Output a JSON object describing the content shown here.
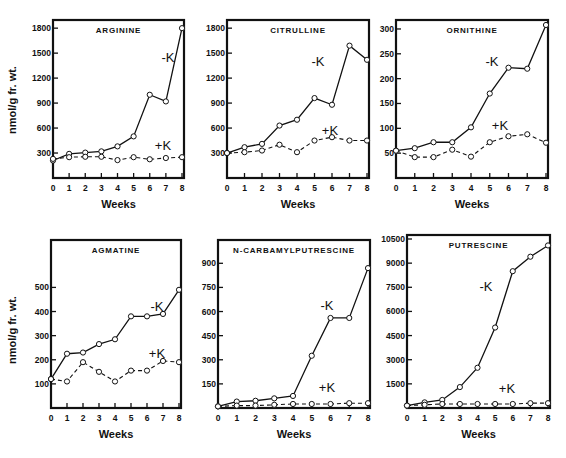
{
  "figure": {
    "y_axis_label": "nmol/g fr. wt.",
    "x_axis_label": "Weeks"
  },
  "chart_data": [
    {
      "type": "line",
      "title": "ARGININE",
      "xlabel": "Weeks",
      "ylabel": "nmol/g fr. wt.",
      "x": [
        0,
        1,
        2,
        3,
        4,
        5,
        6,
        7,
        8
      ],
      "yticks": [
        300,
        600,
        900,
        1200,
        1500,
        1800
      ],
      "ylim": [
        0,
        1850
      ],
      "frame": {
        "x0": 53,
        "x1": 184,
        "y0": 20,
        "y1": 178
      },
      "label_pos": {
        "minusK": [
          168,
          62
        ],
        "plusK": [
          163,
          150
        ]
      },
      "series": [
        {
          "name": "-K",
          "values": [
            210,
            290,
            305,
            320,
            380,
            500,
            1000,
            920,
            1800
          ]
        },
        {
          "name": "+K",
          "values": [
            230,
            250,
            255,
            255,
            215,
            250,
            225,
            240,
            250
          ]
        }
      ]
    },
    {
      "type": "line",
      "title": "CITRULLINE",
      "xlabel": "Weeks",
      "ylabel": "",
      "x": [
        0,
        1,
        2,
        3,
        4,
        5,
        6,
        7,
        8
      ],
      "yticks": [
        300,
        600,
        900,
        1200,
        1500,
        1800
      ],
      "ylim": [
        0,
        1850
      ],
      "frame": {
        "x0": 227,
        "x1": 369,
        "y0": 20,
        "y1": 178
      },
      "label_pos": {
        "minusK": [
          318,
          66
        ],
        "plusK": [
          330,
          135
        ]
      },
      "series": [
        {
          "name": "-K",
          "values": [
            300,
            370,
            410,
            630,
            700,
            960,
            880,
            1590,
            1420
          ]
        },
        {
          "name": "+K",
          "values": [
            300,
            310,
            330,
            400,
            310,
            450,
            490,
            450,
            450
          ]
        }
      ]
    },
    {
      "type": "line",
      "title": "ORNITHINE",
      "xlabel": "Weeks",
      "ylabel": "",
      "x": [
        0,
        1,
        2,
        3,
        4,
        5,
        6,
        7,
        8
      ],
      "yticks": [
        50,
        100,
        150,
        200,
        250,
        300
      ],
      "ylim": [
        0,
        310
      ],
      "frame": {
        "x0": 396,
        "x1": 548,
        "y0": 20,
        "y1": 178
      },
      "label_pos": {
        "minusK": [
          492,
          66
        ],
        "plusK": [
          500,
          130
        ]
      },
      "series": [
        {
          "name": "-K",
          "values": [
            55,
            60,
            72,
            72,
            102,
            170,
            222,
            220,
            308
          ]
        },
        {
          "name": "+K",
          "values": [
            55,
            42,
            42,
            57,
            43,
            72,
            84,
            88,
            71
          ]
        }
      ]
    },
    {
      "type": "line",
      "title": "AGMATINE",
      "xlabel": "Weeks",
      "ylabel": "nmol/g fr. wt.",
      "x": [
        0,
        1,
        2,
        3,
        4,
        5,
        6,
        7,
        8
      ],
      "yticks": [
        100,
        200,
        300,
        400,
        500
      ],
      "ylim": [
        0,
        680
      ],
      "frame": {
        "x0": 51,
        "x1": 181,
        "y0": 240,
        "y1": 408
      },
      "label_pos": {
        "minusK": [
          157,
          311
        ],
        "plusK": [
          157,
          358
        ]
      },
      "series": [
        {
          "name": "-K",
          "values": [
            120,
            225,
            230,
            265,
            285,
            380,
            380,
            390,
            490
          ]
        },
        {
          "name": "+K",
          "values": [
            120,
            110,
            190,
            150,
            110,
            155,
            155,
            195,
            190
          ]
        }
      ]
    },
    {
      "type": "line",
      "title": "N-CARBAMYLPUTRESCINE",
      "title_italic_prefix": "N",
      "xlabel": "Weeks",
      "ylabel": "",
      "x": [
        0,
        1,
        2,
        3,
        4,
        5,
        6,
        7,
        8
      ],
      "yticks": [
        150,
        300,
        450,
        600,
        750,
        900
      ],
      "ylim": [
        0,
        1020
      ],
      "frame": {
        "x0": 218,
        "x1": 370,
        "y0": 240,
        "y1": 408
      },
      "label_pos": {
        "minusK": [
          327,
          310
        ],
        "plusK": [
          327,
          392
        ]
      },
      "series": [
        {
          "name": "-K",
          "values": [
            10,
            40,
            45,
            60,
            75,
            325,
            560,
            560,
            870
          ]
        },
        {
          "name": "+K",
          "values": [
            10,
            15,
            15,
            20,
            25,
            25,
            25,
            30,
            30
          ]
        }
      ]
    },
    {
      "type": "line",
      "title": "PUTRESCINE",
      "xlabel": "Weeks",
      "ylabel": "",
      "x": [
        0,
        1,
        2,
        3,
        4,
        5,
        6,
        7,
        8
      ],
      "yticks": [
        1500,
        3000,
        4500,
        6000,
        7500,
        9000,
        10500
      ],
      "ylim": [
        0,
        10500
      ],
      "frame": {
        "x0": 407,
        "x1": 550,
        "y0": 235,
        "y1": 408
      },
      "label_pos": {
        "minusK": [
          486,
          291
        ],
        "plusK": [
          507,
          393
        ]
      },
      "series": [
        {
          "name": "-K",
          "values": [
            150,
            350,
            500,
            1300,
            2500,
            5000,
            8500,
            9400,
            10100
          ]
        },
        {
          "name": "+K",
          "values": [
            150,
            200,
            250,
            250,
            250,
            250,
            250,
            300,
            300
          ]
        }
      ]
    }
  ]
}
